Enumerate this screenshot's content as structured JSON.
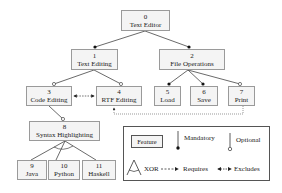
{
  "diagram": {
    "type": "feature-model",
    "nodes": [
      {
        "id": "0",
        "label": "Text Editor"
      },
      {
        "id": "1",
        "label": "Text Editing"
      },
      {
        "id": "2",
        "label": "File Operations"
      },
      {
        "id": "3",
        "label": "Code Editing"
      },
      {
        "id": "4",
        "label": "RTF Editing"
      },
      {
        "id": "5",
        "label": "Load"
      },
      {
        "id": "6",
        "label": "Save"
      },
      {
        "id": "7",
        "label": "Print"
      },
      {
        "id": "8",
        "label": "Syntax Highlighting"
      },
      {
        "id": "9",
        "label": "Java"
      },
      {
        "id": "10",
        "label": "Python"
      },
      {
        "id": "11",
        "label": "Haskell"
      }
    ],
    "edges": [
      {
        "from": "0",
        "to": "1",
        "type": "mandatory"
      },
      {
        "from": "0",
        "to": "2",
        "type": "mandatory"
      },
      {
        "from": "1",
        "to": "3",
        "type": "optional"
      },
      {
        "from": "1",
        "to": "4",
        "type": "optional"
      },
      {
        "from": "2",
        "to": "5",
        "type": "mandatory"
      },
      {
        "from": "2",
        "to": "6",
        "type": "mandatory"
      },
      {
        "from": "2",
        "to": "7",
        "type": "optional"
      },
      {
        "from": "3",
        "to": "8",
        "type": "optional"
      },
      {
        "from": "8",
        "to": "9",
        "type": "xor"
      },
      {
        "from": "8",
        "to": "10",
        "type": "xor"
      },
      {
        "from": "8",
        "to": "11",
        "type": "xor"
      }
    ],
    "constraints": [
      {
        "from": "3",
        "to": "4",
        "type": "excludes"
      },
      {
        "from": "7",
        "to": "4",
        "type": "requires"
      }
    ]
  },
  "legend": {
    "feature": "Feature",
    "mandatory": "Mandatory",
    "optional": "Optional",
    "xor": "XOR",
    "requires": "Requires",
    "excludes": "Excludes"
  }
}
